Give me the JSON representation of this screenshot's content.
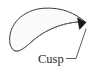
{
  "figure": {
    "type": "geometry-diagram",
    "background_color": "#ffffff",
    "shape": {
      "name": "crescent-region",
      "fill_color": "#fbfbfb",
      "stroke_color": "#3a3a3a",
      "stroke_width": 1,
      "outer_arc": "M 10 44 C 8 24 24 9 44 8 C 62 7 76 13 86 22",
      "inner_arc": "M 86 22 C 70 20 48 27 33 40 C 22 50 14 56 10 44",
      "cusp_point": {
        "x": 86,
        "y": 22
      },
      "rounded_end": {
        "x": 10,
        "y": 44
      }
    },
    "cusp_marker": {
      "name": "cusp-wedge",
      "color": "#1a1a1a",
      "points": "86,22 78,18 80,30"
    },
    "annotation": {
      "label": "Cusp",
      "label_x": 38,
      "label_y": 62,
      "leader_color": "#3a3a3a",
      "leader_path": "M 66 58 L 76 58 L 85 45 L 85 27"
    }
  }
}
